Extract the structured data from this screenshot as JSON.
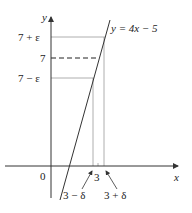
{
  "diagram": {
    "axes": {
      "x_label": "x",
      "y_label": "y",
      "origin_label": "0"
    },
    "line_label": "y = 4x − 5",
    "y_ticks": {
      "upper": "7 + ε",
      "center": "7",
      "lower": "7 − ε"
    },
    "x_ticks": {
      "center": "3",
      "lower": "3 − δ",
      "upper": "3 + δ"
    },
    "colors": {
      "axis": "#333333",
      "guide": "#999999",
      "line": "#333333"
    }
  }
}
